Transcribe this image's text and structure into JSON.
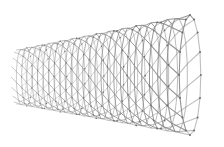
{
  "image": {
    "subject": "carbon nanotube",
    "alt": "3D rendering of a single-walled carbon nanotube with a hexagonal lattice, receding from right to left",
    "background_color": "#ffffff",
    "lattice_color": "#8a8a8a",
    "atom_color": "#6e6e6e"
  }
}
